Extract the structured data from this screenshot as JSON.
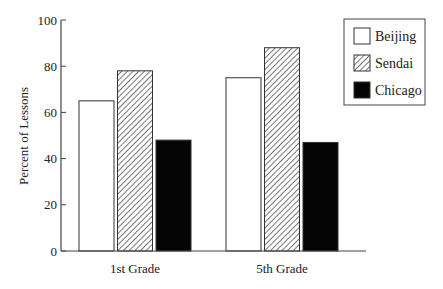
{
  "chart_data": {
    "type": "bar",
    "title": "",
    "xlabel": "",
    "ylabel": "Percent of Lessons",
    "ylim": [
      0,
      100
    ],
    "yticks": [
      0,
      20,
      40,
      60,
      80,
      100
    ],
    "grid": false,
    "legend_position": "top-right (boxed)",
    "categories": [
      "1st Grade",
      "5th Grade"
    ],
    "series": [
      {
        "name": "Beijing",
        "fill": "white",
        "values": [
          65,
          75
        ]
      },
      {
        "name": "Sendai",
        "fill": "diagonal-hatch",
        "values": [
          78,
          88
        ]
      },
      {
        "name": "Chicago",
        "fill": "black",
        "values": [
          48,
          47
        ]
      }
    ]
  },
  "colors": {
    "axis": "#444444",
    "bar_outline": "#333333",
    "solid": "#050505",
    "hatch": "#555555"
  }
}
